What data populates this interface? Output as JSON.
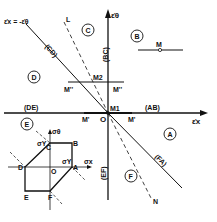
{
  "axes": {
    "x_label": "ε̇x",
    "y_label": "ε̇θ",
    "origin": "O"
  },
  "lines": {
    "cd_label": "(CD)",
    "cd_endpoint": "ε̇x = -ε̇θ",
    "fa_label": "(FA)",
    "bc_label": "(BC)",
    "ab_label": "(AB)",
    "de_label": "(DE)",
    "ef_label": "(EF)",
    "dashed_top": "L",
    "dashed_bottom": "N"
  },
  "regions": {
    "a": "A",
    "b": "B",
    "c": "C",
    "d": "D",
    "e": "E",
    "f": "F"
  },
  "points": {
    "m": "M",
    "m1": "M1",
    "m2": "M2",
    "m_prime_left": "M'",
    "m_prime_right": "M'",
    "m_dbl_left": "M''",
    "m_dbl_right": "M''"
  },
  "inset": {
    "x_axis": "σx",
    "y_axis": "σθ",
    "origin": "O",
    "sy_top": "σY",
    "sy_right": "σY",
    "vertices": [
      "A",
      "B",
      "C",
      "D",
      "E",
      "F"
    ]
  }
}
